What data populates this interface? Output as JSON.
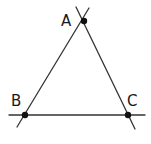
{
  "diagram": {
    "type": "triangle",
    "points": [
      {
        "id": "A",
        "label": "A",
        "x": 84,
        "y": 21,
        "label_x": 61,
        "label_y": 26
      },
      {
        "id": "B",
        "label": "B",
        "x": 25,
        "y": 115,
        "label_x": 11,
        "label_y": 106
      },
      {
        "id": "C",
        "label": "C",
        "x": 128,
        "y": 115,
        "label_x": 127,
        "label_y": 106
      }
    ],
    "lines": [
      {
        "id": "line-AB",
        "through": [
          "A",
          "B"
        ],
        "x1": 89,
        "y1": 8,
        "x2": 17,
        "y2": 127
      },
      {
        "id": "line-AC",
        "through": [
          "A",
          "C"
        ],
        "x1": 76,
        "y1": 7,
        "x2": 135,
        "y2": 129
      },
      {
        "id": "line-BC",
        "through": [
          "B",
          "C"
        ],
        "x1": 9,
        "y1": 115,
        "x2": 145,
        "y2": 115
      }
    ],
    "colors": {
      "stroke": "#333333",
      "point": "#111111",
      "background": "#ffffff"
    }
  }
}
